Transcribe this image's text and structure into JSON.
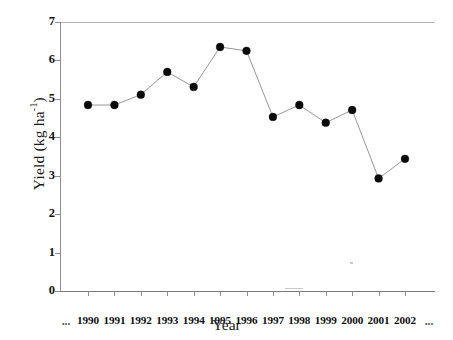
{
  "chart_data": {
    "type": "line",
    "title": "",
    "xlabel": "Year",
    "ylabel": "Yield (kg ha",
    "ylabel_sup": "-1",
    "ylabel_close": ")",
    "categories": [
      "1990",
      "1991",
      "1992",
      "1993",
      "1994",
      "1995",
      "1996",
      "1997",
      "1998",
      "1999",
      "2000",
      "2001",
      "2002"
    ],
    "values": [
      4.84,
      4.84,
      5.11,
      5.7,
      5.31,
      6.35,
      6.25,
      4.53,
      4.84,
      4.38,
      4.71,
      2.93,
      3.44
    ],
    "yticks": [
      0,
      1,
      2,
      3,
      4,
      5,
      6,
      7
    ],
    "ytick_labels": [
      "0",
      "1",
      "2",
      "3",
      "4",
      "5",
      "6",
      "7"
    ],
    "ylim": [
      0,
      7
    ],
    "grid": false,
    "legend": null,
    "marker": "filled-circle",
    "line_color": "#8a8a8a",
    "marker_color": "#0a0a0a",
    "x_edge_labels": {
      "left": "...",
      "right": "..."
    }
  }
}
